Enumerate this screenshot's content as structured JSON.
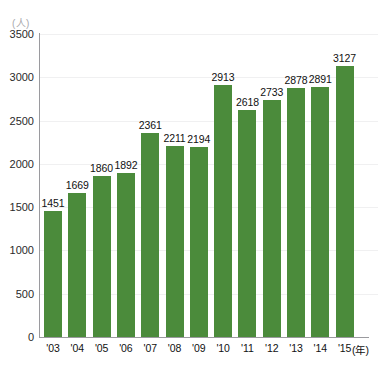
{
  "chart_data": {
    "type": "bar",
    "title": "",
    "xlabel": "(年)",
    "ylabel": "(人)",
    "categories": [
      "'03",
      "'04",
      "'05",
      "'06",
      "'07",
      "'08",
      "'09",
      "'10",
      "'11",
      "'12",
      "'13",
      "'14",
      "'15"
    ],
    "values": [
      1451,
      1669,
      1860,
      1892,
      2361,
      2211,
      2194,
      2913,
      2618,
      2733,
      2878,
      2891,
      3127
    ],
    "ylim": [
      0,
      3500
    ],
    "yticks": [
      0,
      500,
      1000,
      1500,
      2000,
      2500,
      3000,
      3500
    ],
    "ytick_labels": [
      "0",
      "500",
      "1000",
      "1500",
      "2000",
      "2500",
      "3000",
      "3500"
    ],
    "grid": true,
    "legend": "none",
    "bar_color": "#4b8b3b",
    "data_labels": [
      "1451",
      "1669",
      "1860",
      "1892",
      "2361",
      "2211",
      "2194",
      "2913",
      "2618",
      "2733",
      "2878",
      "2891",
      "3127"
    ]
  },
  "axes": {
    "y_unit_label": "(人)",
    "x_unit_label": "(年)"
  },
  "colors": {
    "bar": "#4b8b3b",
    "axis": "#9a9a9e",
    "grid": "#f0f0f1",
    "text": "#111111",
    "background": "#ffffff"
  }
}
